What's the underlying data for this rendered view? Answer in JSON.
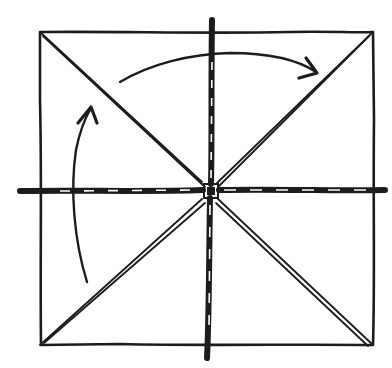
{
  "diagram": {
    "type": "hand-drawn sketch",
    "colors": {
      "ink": "#1c1c1c",
      "background": "#ffffff"
    },
    "square": {
      "x1": 40,
      "y1": 32,
      "x2": 373,
      "y2": 345
    },
    "center": {
      "x": 211,
      "y": 191
    },
    "cross_lines": [
      {
        "name": "vertical",
        "x1": 211,
        "y1": 20,
        "x2": 207,
        "y2": 358
      },
      {
        "name": "horizontal",
        "x1": 20,
        "y1": 191,
        "x2": 385,
        "y2": 190
      }
    ],
    "diagonals": [
      {
        "name": "top-left",
        "x1": 40,
        "y1": 32
      },
      {
        "name": "top-right",
        "x1": 373,
        "y1": 32
      },
      {
        "name": "bottom-left",
        "x1": 40,
        "y1": 345
      },
      {
        "name": "bottom-right",
        "x1": 373,
        "y1": 345
      }
    ],
    "arrows": [
      {
        "name": "left-arrow",
        "direction": "up",
        "from": [
          88,
          282
        ],
        "to": [
          92,
          107
        ]
      },
      {
        "name": "top-arrow",
        "direction": "right",
        "from": [
          120,
          81
        ],
        "to": [
          316,
          72
        ]
      }
    ],
    "labels": []
  }
}
